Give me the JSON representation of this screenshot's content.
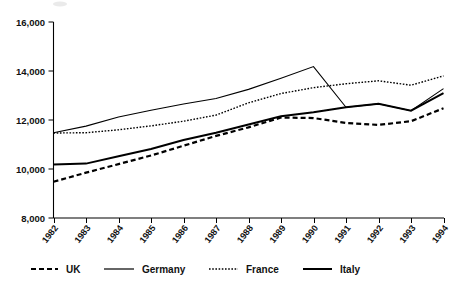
{
  "chart_data": {
    "type": "line",
    "title": "",
    "subtitle": "",
    "xlabel": "",
    "ylabel": "",
    "x": [
      1982,
      1983,
      1984,
      1985,
      1986,
      1987,
      1988,
      1989,
      1990,
      1991,
      1992,
      1993,
      1994
    ],
    "categories": [
      "1982",
      "1983",
      "1984",
      "1985",
      "1986",
      "1987",
      "1988",
      "1989",
      "1990",
      "1991",
      "1992",
      "1993",
      "1994"
    ],
    "xlim": [
      1982,
      1994
    ],
    "ylim": [
      8000,
      16000
    ],
    "ytick_values": [
      8000,
      10000,
      12000,
      14000,
      16000
    ],
    "ytick_labels": [
      "8,000",
      "10,000",
      "12,000",
      "14,000",
      "16,000"
    ],
    "xtick_labels": [
      "1982",
      "1983",
      "1984",
      "1985",
      "1986",
      "1987",
      "1988",
      "1989",
      "1990",
      "1991",
      "1992",
      "1993",
      "1994"
    ],
    "grid": false,
    "legend_position": "bottom",
    "series": [
      {
        "name": "UK",
        "style": "dashed",
        "dash": "5,3",
        "width": 2.2,
        "color": "#000000",
        "values": [
          9480,
          9850,
          10200,
          10550,
          10950,
          11350,
          11700,
          12100,
          12080,
          11880,
          11800,
          11950,
          12480
        ]
      },
      {
        "name": "Germany",
        "style": "solid",
        "dash": "none",
        "width": 1.1,
        "color": "#000000",
        "values": [
          11480,
          11750,
          12120,
          12400,
          12650,
          12880,
          13250,
          13700,
          14180,
          12520,
          12660,
          12380,
          13280
        ]
      },
      {
        "name": "France",
        "style": "dotted",
        "dash": "1.6,1.6",
        "width": 1.4,
        "color": "#000000",
        "values": [
          11470,
          11480,
          11600,
          11760,
          11950,
          12200,
          12700,
          13080,
          13320,
          13480,
          13600,
          13420,
          13800
        ]
      },
      {
        "name": "Italy",
        "style": "solid",
        "dash": "none",
        "width": 2.0,
        "color": "#000000",
        "values": [
          10180,
          10220,
          10520,
          10820,
          11180,
          11480,
          11820,
          12150,
          12320,
          12520,
          12660,
          12380,
          13100
        ]
      }
    ],
    "legend": [
      {
        "label": "UK",
        "style": "dashed",
        "dash": "5,3",
        "width": 2.2
      },
      {
        "label": "Germany",
        "style": "solid",
        "dash": "none",
        "width": 1.1
      },
      {
        "label": "France",
        "style": "dotted",
        "dash": "1.6,1.6",
        "width": 1.4
      },
      {
        "label": "Italy",
        "style": "solid",
        "dash": "none",
        "width": 2.0
      }
    ]
  },
  "axes": {
    "y_labels": [
      "16,000",
      "14,000",
      "12,000",
      "10,000",
      "8,000"
    ],
    "x_labels": [
      "1982",
      "1983",
      "1984",
      "1985",
      "1986",
      "1987",
      "1988",
      "1989",
      "1990",
      "1991",
      "1992",
      "1993",
      "1994"
    ]
  },
  "legend_labels": {
    "uk": "UK",
    "germany": "Germany",
    "france": "France",
    "italy": "Italy"
  }
}
